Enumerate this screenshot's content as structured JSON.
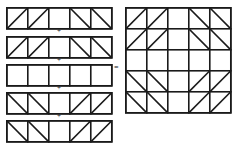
{
  "diagram": {
    "operator_plus": "+",
    "operator_equals": "=",
    "colors": {
      "line": "#1a1a1a",
      "background": "#ffffff",
      "cell_fill": "#ffffff"
    },
    "grid": {
      "columns": 5,
      "rows": 5,
      "cell_width": 21,
      "cell_height": 21,
      "stroke_width": 1.6,
      "diag_stroke_width": 1.6
    },
    "strips": [
      {
        "index": 1,
        "label": "strip-1",
        "cells": [
          "slash",
          "slash",
          "empty",
          "backslash",
          "backslash"
        ]
      },
      {
        "index": 2,
        "label": "strip-2",
        "cells": [
          "slash",
          "slash",
          "empty",
          "backslash",
          "backslash"
        ]
      },
      {
        "index": 3,
        "label": "strip-3",
        "cells": [
          "empty",
          "empty",
          "empty",
          "empty",
          "empty"
        ]
      },
      {
        "index": 4,
        "label": "strip-4",
        "cells": [
          "backslash",
          "backslash",
          "empty",
          "slash",
          "slash"
        ]
      },
      {
        "index": 5,
        "label": "strip-5",
        "cells": [
          "backslash",
          "backslash",
          "empty",
          "slash",
          "slash"
        ]
      }
    ],
    "result": {
      "label": "result-grid",
      "rows": [
        [
          "slash",
          "slash",
          "empty",
          "backslash",
          "backslash"
        ],
        [
          "slash",
          "slash",
          "empty",
          "backslash",
          "backslash"
        ],
        [
          "empty",
          "empty",
          "empty",
          "empty",
          "empty"
        ],
        [
          "backslash",
          "backslash",
          "empty",
          "slash",
          "slash"
        ],
        [
          "backslash",
          "backslash",
          "empty",
          "slash",
          "slash"
        ]
      ]
    }
  }
}
